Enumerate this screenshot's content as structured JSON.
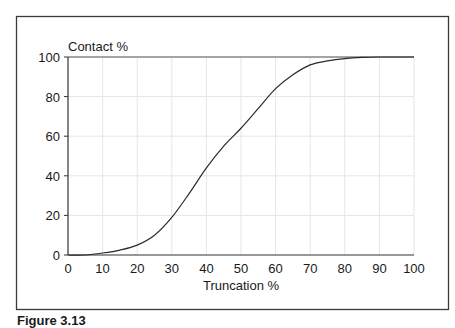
{
  "chart_data": {
    "type": "line",
    "title": "",
    "xlabel": "Truncation %",
    "ylabel": "Contact %",
    "xlim": [
      0,
      100
    ],
    "ylim": [
      0,
      100
    ],
    "x_ticks": [
      0,
      10,
      20,
      30,
      40,
      50,
      60,
      70,
      80,
      90,
      100
    ],
    "y_ticks": [
      0,
      20,
      40,
      60,
      80,
      100
    ],
    "grid": true,
    "legend": null,
    "series": [
      {
        "name": "Contact %",
        "x": [
          0,
          5,
          10,
          15,
          20,
          25,
          30,
          35,
          40,
          45,
          50,
          55,
          60,
          65,
          70,
          75,
          80,
          85,
          90,
          95,
          100
        ],
        "values": [
          0,
          0,
          1,
          2.5,
          5,
          10,
          19,
          31,
          44,
          55,
          64,
          74,
          84,
          91,
          96,
          98,
          99.2,
          99.8,
          100,
          100,
          100
        ]
      }
    ]
  },
  "figure": {
    "caption": "Figure 3.13"
  },
  "colors": {
    "line": "#2a2a2a",
    "frame": "#3a3a3a",
    "grid": "#e6e6e6",
    "axis": "#333333"
  }
}
